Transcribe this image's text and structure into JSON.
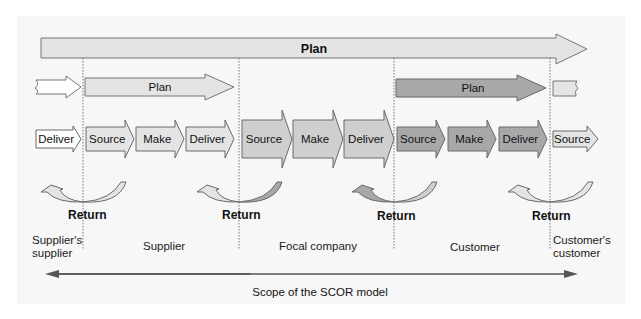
{
  "diagram": {
    "title": "Scope of the SCOR model",
    "colors": {
      "background": "#f7f7f7",
      "light_fill": "#e4e4e4",
      "mid_fill": "#cfcfcf",
      "dark_fill": "#a8a8a8",
      "white_fill": "#ffffff",
      "stroke": "#6a6a6a"
    },
    "top_plan": {
      "label": "Plan"
    },
    "entity_plans": [
      {
        "label": "Plan",
        "entity": "Supplier"
      },
      {
        "label": "Plan",
        "entity": "Customer"
      }
    ],
    "process_row": [
      {
        "label": "Deliver",
        "entity": "Supplier's supplier"
      },
      {
        "label": "Source",
        "entity": "Supplier"
      },
      {
        "label": "Make",
        "entity": "Supplier"
      },
      {
        "label": "Deliver",
        "entity": "Supplier"
      },
      {
        "label": "Source",
        "entity": "Focal company"
      },
      {
        "label": "Make",
        "entity": "Focal company"
      },
      {
        "label": "Deliver",
        "entity": "Focal company"
      },
      {
        "label": "Source",
        "entity": "Customer"
      },
      {
        "label": "Make",
        "entity": "Customer"
      },
      {
        "label": "Deliver",
        "entity": "Customer"
      },
      {
        "label": "Source",
        "entity": "Customer's customer"
      }
    ],
    "returns": [
      {
        "label": "Return"
      },
      {
        "label": "Return"
      },
      {
        "label": "Return"
      },
      {
        "label": "Return"
      }
    ],
    "entities": [
      {
        "line1": "Supplier's",
        "line2": "supplier"
      },
      {
        "line1": "Supplier",
        "line2": ""
      },
      {
        "line1": "Focal company",
        "line2": ""
      },
      {
        "line1": "Customer",
        "line2": ""
      },
      {
        "line1": "Customer's",
        "line2": "customer"
      }
    ],
    "scope_label": "Scope of the SCOR model"
  }
}
